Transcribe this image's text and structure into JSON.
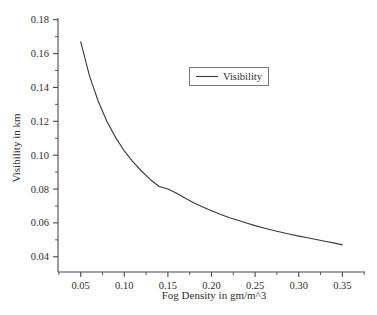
{
  "chart_data": {
    "type": "line",
    "title": "",
    "xlabel": "Fog Density in gm/m^3",
    "ylabel": "Visibility in km",
    "xlim": [
      0.024,
      0.376
    ],
    "ylim": [
      0.031,
      0.181
    ],
    "xticks": [
      0.05,
      0.1,
      0.15,
      0.2,
      0.25,
      0.3,
      0.35
    ],
    "xticklabels": [
      "0.05",
      "0.10",
      "0.15",
      "0.20",
      "0.25",
      "0.30",
      "0.35"
    ],
    "yticks": [
      0.04,
      0.06,
      0.08,
      0.1,
      0.12,
      0.14,
      0.16,
      0.18
    ],
    "yticklabels": [
      "0.04",
      "0.06",
      "0.08",
      "0.10",
      "0.12",
      "0.14",
      "0.16",
      "0.18"
    ],
    "minor_ticks": true,
    "grid": false,
    "legend_position": "upper-center",
    "series": [
      {
        "name": "Visibility",
        "color": "#3a3a3a",
        "x": [
          0.05,
          0.06,
          0.07,
          0.08,
          0.09,
          0.1,
          0.11,
          0.12,
          0.13,
          0.14,
          0.15,
          0.16,
          0.17,
          0.18,
          0.19,
          0.2,
          0.21,
          0.22,
          0.23,
          0.24,
          0.25,
          0.26,
          0.27,
          0.28,
          0.29,
          0.3,
          0.31,
          0.32,
          0.33,
          0.34,
          0.35
        ],
        "y": [
          0.167,
          0.147,
          0.132,
          0.12,
          0.1105,
          0.1025,
          0.096,
          0.0905,
          0.0855,
          0.0815,
          0.08,
          0.0775,
          0.0745,
          0.0718,
          0.0694,
          0.0672,
          0.0651,
          0.0632,
          0.0615,
          0.0599,
          0.0584,
          0.057,
          0.0557,
          0.0545,
          0.0533,
          0.0522,
          0.0512,
          0.0502,
          0.0492,
          0.0482,
          0.047
        ]
      }
    ]
  },
  "legend": {
    "entries": [
      {
        "label": "Visibility"
      }
    ]
  },
  "axes": {
    "x_title": "Fog Density in gm/m^3",
    "y_title": "Visibility in km"
  }
}
